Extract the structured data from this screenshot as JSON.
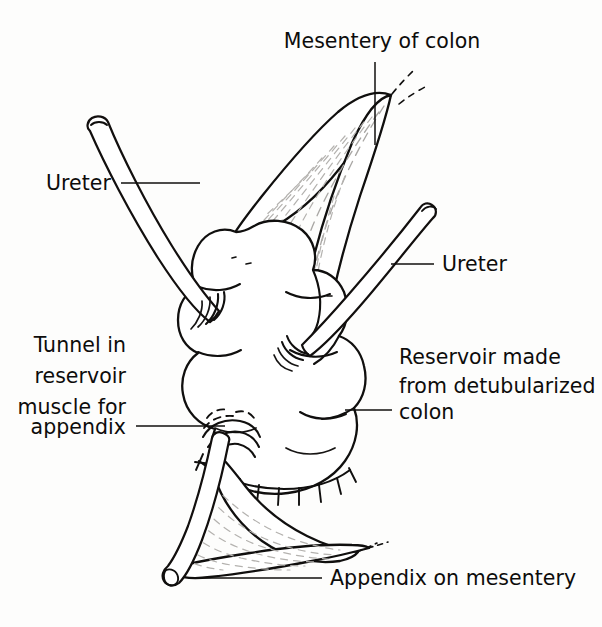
{
  "figure": {
    "background_color": "#fdfdfc",
    "ink_color": "#100f0e",
    "vessel_color": "#a9a7a4"
  },
  "labels": {
    "mesentery_of_colon": {
      "text": "Mesentery of colon",
      "name": "label-mesentery-of-colon",
      "x": 382,
      "y": 48,
      "anchor": "middle"
    },
    "ureter_left": {
      "text": "Ureter",
      "name": "label-ureter-left",
      "x": 111,
      "y": 190,
      "anchor": "end"
    },
    "ureter_right": {
      "text": "Ureter",
      "name": "label-ureter-right",
      "x": 442,
      "y": 271,
      "anchor": "start"
    },
    "tunnel_in_reservoir": {
      "name": "label-tunnel-in-reservoir-muscle",
      "lines": [
        "Tunnel in",
        "reservoir",
        "muscle for",
        "appendix"
      ],
      "x": 126,
      "y": 352,
      "line_height": 31,
      "anchor": "end"
    },
    "reservoir_made_from_colon": {
      "name": "label-reservoir-made-from-detubularized-colon",
      "lines": [
        "Reservoir made",
        "from detubularized",
        "colon"
      ],
      "x": 399,
      "y": 364,
      "line_height": 30,
      "anchor": "start"
    },
    "appendix_on_mesentery": {
      "text": "Appendix on mesentery",
      "name": "label-appendix-on-mesentery",
      "x": 330,
      "y": 585,
      "anchor": "start"
    }
  },
  "leaders": {
    "mesentery_of_colon": "M 375 62 L 375 145",
    "ureter_left": "M 121 183 L 200 183",
    "ureter_right": "M 434 264 L 391 264",
    "tunnel_in_reservoir": "M 136 426 L 225 426",
    "reservoir_made_from_colon": "M 392 410 L 345 410",
    "appendix_on_mesentery": "M 322 578 L 203 578"
  },
  "parts": {
    "reservoir": "detubularized colon reservoir",
    "mesentery": "mesentery of colon",
    "ureter_left_tube": "left ureter",
    "ureter_right_tube": "right ureter",
    "appendix_tube": "appendix channel",
    "appendix_mesentery": "appendix mesentery",
    "suture_line": "closure suture line",
    "tunnel": "submucosal tunnel for appendix"
  }
}
